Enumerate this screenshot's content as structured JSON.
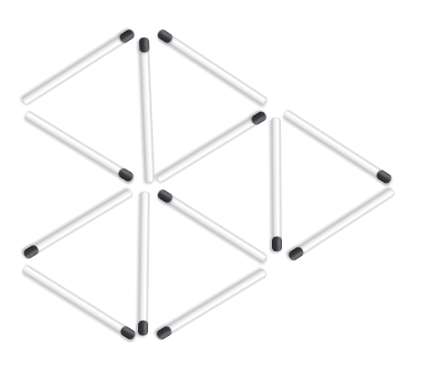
{
  "scene": {
    "title": "Matchstick geometry puzzle",
    "description": "Twelve matchsticks arranged into two rhombi and a triangle on a white background",
    "background_color": "#ffffff",
    "width": 430,
    "height": 370,
    "match_count": 12
  },
  "style": {
    "stick_body_light": "#fdfdfd",
    "stick_body_mid": "#eeeeee",
    "stick_body_edge": "#c9c9c9",
    "stick_shadow": "#b4b4b4",
    "head_dark": "#303033",
    "head_mid": "#45454a",
    "head_highlight": "#6e6e74",
    "stick_width": 8.5,
    "head_length": 15
  },
  "matches": [
    {
      "id": "match-1",
      "name": "upper-left-rhombus-top-edge",
      "x1": 132,
      "y1": 33,
      "x2": 24,
      "y2": 102,
      "head_at": "start",
      "orientation": "diagonal-down-left"
    },
    {
      "id": "match-2",
      "name": "upper-left-rhombus-bottom-edge",
      "x1": 26,
      "y1": 114,
      "x2": 131,
      "y2": 178,
      "head_at": "end",
      "orientation": "diagonal-down-right"
    },
    {
      "id": "match-3",
      "name": "upper-center-vertical",
      "x1": 144,
      "y1": 39,
      "x2": 150,
      "y2": 182,
      "head_at": "start",
      "orientation": "vertical"
    },
    {
      "id": "match-4",
      "name": "upper-right-rhombus-top-edge",
      "x1": 160,
      "y1": 33,
      "x2": 265,
      "y2": 102,
      "head_at": "start",
      "orientation": "diagonal-down-right"
    },
    {
      "id": "match-5",
      "name": "upper-right-rhombus-bottom-edge",
      "x1": 264,
      "y1": 115,
      "x2": 158,
      "y2": 180,
      "head_at": "start",
      "orientation": "diagonal-down-left"
    },
    {
      "id": "match-6",
      "name": "right-triangle-left-vertical",
      "x1": 276,
      "y1": 118,
      "x2": 277,
      "y2": 250,
      "head_at": "end",
      "orientation": "vertical"
    },
    {
      "id": "match-7",
      "name": "right-triangle-top-edge",
      "x1": 285,
      "y1": 113,
      "x2": 389,
      "y2": 180,
      "head_at": "end",
      "orientation": "diagonal-down-right"
    },
    {
      "id": "match-8",
      "name": "right-triangle-bottom-edge",
      "x1": 393,
      "y1": 191,
      "x2": 291,
      "y2": 257,
      "head_at": "end",
      "orientation": "diagonal-down-left"
    },
    {
      "id": "match-9",
      "name": "lower-left-rhombus-top-edge",
      "x1": 131,
      "y1": 192,
      "x2": 26,
      "y2": 255,
      "head_at": "end",
      "orientation": "diagonal-down-left"
    },
    {
      "id": "match-10",
      "name": "lower-left-rhombus-bottom-edge",
      "x1": 24,
      "y1": 268,
      "x2": 133,
      "y2": 336,
      "head_at": "end",
      "orientation": "diagonal-down-right"
    },
    {
      "id": "match-11",
      "name": "lower-center-vertical",
      "x1": 145,
      "y1": 192,
      "x2": 143,
      "y2": 334,
      "head_at": "end",
      "orientation": "vertical"
    },
    {
      "id": "match-12",
      "name": "lower-right-rhombus-top-edge",
      "x1": 160,
      "y1": 193,
      "x2": 265,
      "y2": 259,
      "head_at": "start",
      "orientation": "diagonal-down-right"
    },
    {
      "id": "match-13",
      "name": "lower-right-rhombus-bottom-edge",
      "x1": 265,
      "y1": 272,
      "x2": 159,
      "y2": 336,
      "head_at": "end",
      "orientation": "diagonal-down-left"
    }
  ]
}
